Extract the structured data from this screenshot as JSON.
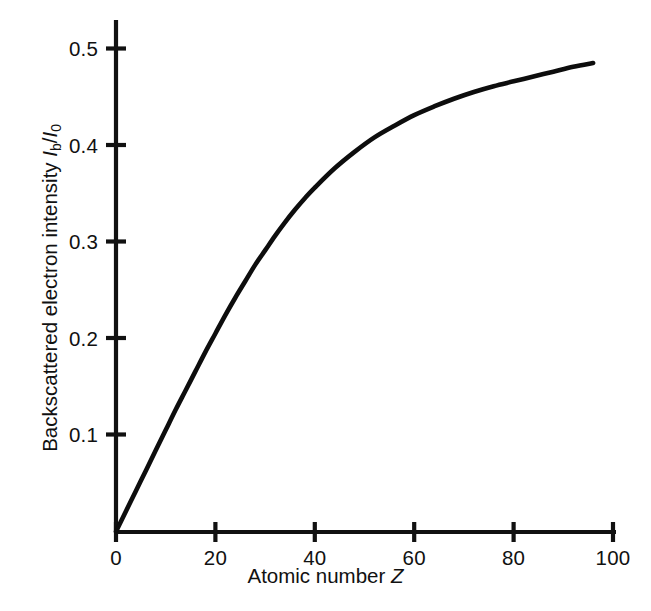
{
  "chart_data": {
    "type": "line",
    "title": "",
    "subtitle": "",
    "xlabel_prefix": "Atomic number ",
    "xlabel_symbol": "Z",
    "ylabel_prefix": "Backscattered electron intensity ",
    "ylabel_symbol_numerator": "I",
    "ylabel_sub_numerator": "b",
    "ylabel_divider": "/",
    "ylabel_symbol_denominator": "I",
    "ylabel_sub_denominator": "0",
    "xlabel_full": "Atomic number Z",
    "ylabel_full": "Backscattered electron intensity Ib/I0",
    "xlim": [
      0,
      104
    ],
    "ylim": [
      0,
      0.52
    ],
    "grid": false,
    "legend": "none",
    "xticks": [
      0,
      20,
      40,
      60,
      80,
      100
    ],
    "xtick_labels": [
      "0",
      "20",
      "40",
      "60",
      "80",
      "100"
    ],
    "yticks": [
      0.1,
      0.2,
      0.3,
      0.4,
      0.5
    ],
    "ytick_labels": [
      "0.1",
      "0.2",
      "0.3",
      "0.4",
      "0.5"
    ],
    "series": [
      {
        "name": "Backscattered electron intensity",
        "color": "#0d0d0d",
        "x": [
          0,
          2,
          4,
          6,
          8,
          10,
          12,
          14,
          16,
          18,
          20,
          22,
          24,
          26,
          28,
          30,
          32,
          34,
          36,
          38,
          40,
          44,
          48,
          52,
          56,
          60,
          64,
          68,
          72,
          76,
          80,
          84,
          88,
          92,
          96
        ],
        "y": [
          0.0,
          0.021,
          0.042,
          0.063,
          0.084,
          0.105,
          0.126,
          0.146,
          0.166,
          0.186,
          0.205,
          0.224,
          0.242,
          0.259,
          0.276,
          0.291,
          0.306,
          0.32,
          0.333,
          0.345,
          0.356,
          0.376,
          0.393,
          0.408,
          0.42,
          0.431,
          0.44,
          0.448,
          0.455,
          0.461,
          0.466,
          0.471,
          0.476,
          0.481,
          0.485
        ]
      }
    ],
    "axis_color": "#111111",
    "background": "#ffffff"
  },
  "figure": {
    "caption": ""
  }
}
